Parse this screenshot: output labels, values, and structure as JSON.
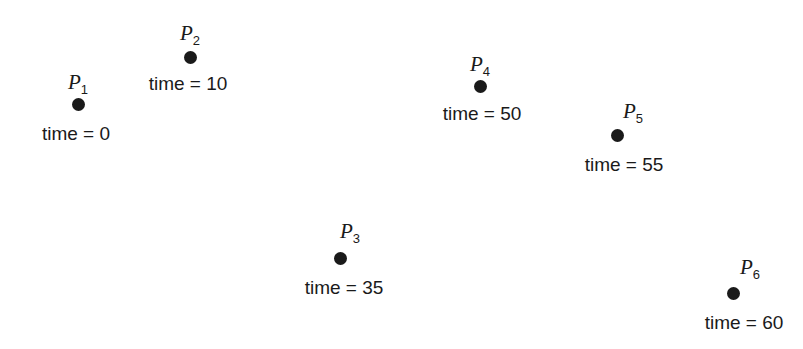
{
  "figure": {
    "background_color": "#ffffff",
    "marker_color": "#1a1a1a",
    "text_color": "#1a1a1a",
    "width": 803,
    "height": 349
  },
  "chart_data": {
    "type": "scatter",
    "title": "",
    "xlabel": "",
    "ylabel": "",
    "grid": false,
    "legend": "none",
    "axes_visible": false,
    "xlim": [
      0,
      803
    ],
    "ylim": [
      0,
      349
    ],
    "point_label_prefix": "P",
    "caption_prefix": "time = ",
    "series": [
      {
        "name": "events",
        "points": [
          {
            "id": "P1",
            "index": "1",
            "time": "0",
            "caption": "time = 0",
            "x": 78,
            "y": 104
          },
          {
            "id": "P2",
            "index": "2",
            "time": "10",
            "caption": "time = 10",
            "x": 190,
            "y": 57
          },
          {
            "id": "P3",
            "index": "3",
            "time": "35",
            "caption": "time = 35",
            "x": 340,
            "y": 258
          },
          {
            "id": "P4",
            "index": "4",
            "time": "50",
            "caption": "time = 50",
            "x": 480,
            "y": 86
          },
          {
            "id": "P5",
            "index": "5",
            "time": "55",
            "caption": "time = 55",
            "x": 617,
            "y": 135
          },
          {
            "id": "P6",
            "index": "6",
            "time": "60",
            "caption": "time = 60",
            "x": 733,
            "y": 293
          }
        ]
      }
    ]
  },
  "points": [
    {
      "name": "P",
      "subscript": "1",
      "caption": "time = 0",
      "label_x": 78,
      "label_y": 82,
      "dot_x": 78,
      "dot_y": 104,
      "caption_x": 76,
      "caption_y": 133
    },
    {
      "name": "P",
      "subscript": "2",
      "caption": "time = 10",
      "label_x": 190,
      "label_y": 33,
      "dot_x": 190,
      "dot_y": 57,
      "caption_x": 188,
      "caption_y": 83
    },
    {
      "name": "P",
      "subscript": "3",
      "caption": "time = 35",
      "label_x": 350,
      "label_y": 231,
      "dot_x": 340,
      "dot_y": 258,
      "caption_x": 344,
      "caption_y": 287
    },
    {
      "name": "P",
      "subscript": "4",
      "caption": "time = 50",
      "label_x": 480,
      "label_y": 64,
      "dot_x": 480,
      "dot_y": 86,
      "caption_x": 482,
      "caption_y": 113
    },
    {
      "name": "P",
      "subscript": "5",
      "caption": "time = 55",
      "label_x": 633,
      "label_y": 111,
      "dot_x": 617,
      "dot_y": 135,
      "caption_x": 624,
      "caption_y": 164
    },
    {
      "name": "P",
      "subscript": "6",
      "caption": "time = 60",
      "label_x": 750,
      "label_y": 267,
      "dot_x": 733,
      "dot_y": 293,
      "caption_x": 744,
      "caption_y": 322
    }
  ]
}
